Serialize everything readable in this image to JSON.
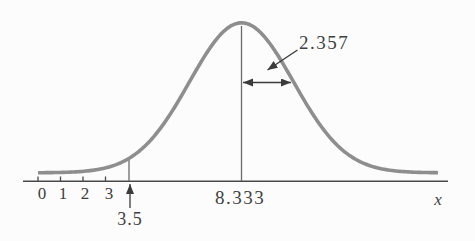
{
  "figure": {
    "background": "#fcfcfc",
    "colors": {
      "curve": "#8e8e8e",
      "axis": "#4a4a4a",
      "guide_line": "#6b6b6b",
      "arrow": "#3b3b3b",
      "text": "#3f3f3f"
    },
    "axis": {
      "label": "x",
      "tick_labels": [
        "0",
        "1",
        "2",
        "3"
      ]
    },
    "labels": {
      "mean": "8.333",
      "sd": "2.357",
      "pointer": "3.5"
    }
  },
  "chart_data": {
    "type": "line",
    "subtype": "normal-distribution-curve",
    "title": "",
    "xlabel": "x",
    "ylabel": "",
    "mean": 8.333,
    "standard_deviation": 2.357,
    "highlighted_x": 3.5,
    "x_ticks": [
      0,
      1,
      2,
      3
    ],
    "grid": false,
    "legend": false,
    "annotations": [
      {
        "text": "8.333",
        "meaning": "mean of the normal curve, marked by center vertical line"
      },
      {
        "text": "2.357",
        "meaning": "standard deviation, shown by double-headed arrow from mean toward right inflection"
      },
      {
        "text": "3.5",
        "meaning": "value on x-axis marked with small vertical segment on curve and upward arrow below axis"
      },
      {
        "text": "x",
        "meaning": "horizontal axis variable label"
      }
    ]
  }
}
